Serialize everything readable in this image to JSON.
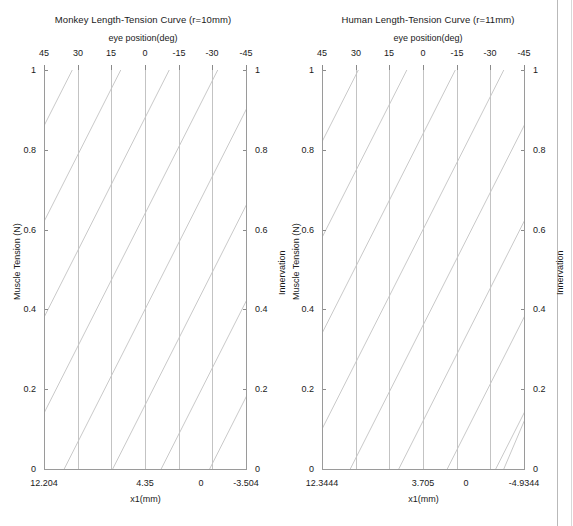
{
  "figure": {
    "background": "#ffffff",
    "curve_color": "#c9c9c9",
    "frame_color": "#9a9a9a",
    "grid_color": "#c3c3c3"
  },
  "chart_data": [
    {
      "type": "line",
      "panel": "left",
      "title": "Monkey Length-Tension Curve (r=10mm)",
      "top_axis_label": "eye position(deg)",
      "xlabel": "x1(mm)",
      "ylabel_left": "Muscle Tension (N)",
      "ylabel_right": "Innervation",
      "top_ticks": [
        "45",
        "30",
        "15",
        "0",
        "-15",
        "-30",
        "-45"
      ],
      "top_tick_values": [
        45,
        30,
        15,
        0,
        -15,
        -30,
        -45
      ],
      "xlim_deg": [
        45,
        -45
      ],
      "ylim": [
        0,
        1
      ],
      "y_ticks_left": [
        "0",
        "0.2",
        "0.4",
        "0.6",
        "0.8",
        "1"
      ],
      "y_tick_values_left": [
        0,
        0.2,
        0.4,
        0.6,
        0.8,
        1
      ],
      "y_ticks_right": [
        "0",
        "0.2",
        "0.4",
        "0.6",
        "0.8",
        "1"
      ],
      "y_tick_values_right": [
        0,
        0.2,
        0.4,
        0.6,
        0.8,
        1
      ],
      "x1_axis_labels": [
        "12.204",
        "4.35",
        "0",
        "-3.504"
      ],
      "x1_axis_values": [
        12.204,
        4.35,
        0,
        -3.504
      ],
      "x1_axis_positions_frac": [
        0.0,
        0.5,
        0.777,
        1.0
      ],
      "zero_corner_labels": [
        "0",
        "0"
      ],
      "grid": "vertical-only",
      "legend": "none",
      "series_description": "Family of parallel length-tension lines, one per innervation level; each rises linearly from the x-axis toward the upper-right, cropped by the plot box.",
      "series": [
        {
          "name": "L1",
          "x_start_frac": -0.62,
          "y_start": 0.0,
          "x_end_frac": 0.38,
          "y_end": 1.0
        },
        {
          "name": "L2",
          "x_start_frac": -0.38,
          "y_start": 0.0,
          "x_end_frac": 0.62,
          "y_end": 1.0
        },
        {
          "name": "L3",
          "x_start_frac": -0.14,
          "y_start": 0.0,
          "x_end_frac": 0.86,
          "y_end": 1.0
        },
        {
          "name": "L4",
          "x_start_frac": 0.1,
          "y_start": 0.0,
          "x_end_frac": 1.1,
          "y_end": 1.0
        },
        {
          "name": "L5",
          "x_start_frac": 0.34,
          "y_start": 0.0,
          "x_end_frac": 1.34,
          "y_end": 1.0
        },
        {
          "name": "L6",
          "x_start_frac": 0.58,
          "y_start": 0.0,
          "x_end_frac": 1.58,
          "y_end": 1.0
        },
        {
          "name": "L7",
          "x_start_frac": 0.82,
          "y_start": 0.0,
          "x_end_frac": 1.82,
          "y_end": 1.0
        },
        {
          "name": "L8",
          "x_start_frac": -0.86,
          "y_start": 0.0,
          "x_end_frac": 0.14,
          "y_end": 1.0
        }
      ]
    },
    {
      "type": "line",
      "panel": "right",
      "title": "Human Length-Tension Curve (r=11mm)",
      "top_axis_label": "eye position(deg)",
      "xlabel": "x1(mm)",
      "ylabel_left": "Muscle Tension (N)",
      "ylabel_right": "Innervation",
      "top_ticks": [
        "45",
        "30",
        "15",
        "0",
        "-15",
        "-30",
        "-45"
      ],
      "top_tick_values": [
        45,
        30,
        15,
        0,
        -15,
        -30,
        -45
      ],
      "xlim_deg": [
        45,
        -45
      ],
      "ylim": [
        0,
        1
      ],
      "y_ticks_left": [
        "0",
        "0.2",
        "0.4",
        "0.6",
        "0.8",
        "1"
      ],
      "y_tick_values_left": [
        0,
        0.2,
        0.4,
        0.6,
        0.8,
        1
      ],
      "y_ticks_right": [
        "0",
        "0.2",
        "0.4",
        "0.6",
        "0.8",
        "1"
      ],
      "y_tick_values_right": [
        0,
        0.2,
        0.4,
        0.6,
        0.8,
        1
      ],
      "x1_axis_labels": [
        "12.3444",
        "3.705",
        "0",
        "-4.9344"
      ],
      "x1_axis_values": [
        12.3444,
        3.705,
        0,
        -4.9344
      ],
      "x1_axis_positions_frac": [
        0.0,
        0.5,
        0.715,
        1.0
      ],
      "zero_corner_labels": [
        "0",
        "0"
      ],
      "grid": "vertical-only",
      "legend": "none",
      "series_description": "Family of parallel length-tension lines, one per innervation level; each rises linearly from the x-axis toward the upper-right, cropped by the plot box.",
      "series": [
        {
          "name": "L1",
          "x_start_frac": -0.58,
          "y_start": 0.0,
          "x_end_frac": 0.42,
          "y_end": 1.0
        },
        {
          "name": "L2",
          "x_start_frac": -0.34,
          "y_start": 0.0,
          "x_end_frac": 0.66,
          "y_end": 1.0
        },
        {
          "name": "L3",
          "x_start_frac": -0.1,
          "y_start": 0.0,
          "x_end_frac": 0.9,
          "y_end": 1.0
        },
        {
          "name": "L4",
          "x_start_frac": 0.14,
          "y_start": 0.0,
          "x_end_frac": 1.14,
          "y_end": 1.0
        },
        {
          "name": "L5",
          "x_start_frac": 0.38,
          "y_start": 0.0,
          "x_end_frac": 1.38,
          "y_end": 1.0
        },
        {
          "name": "L6",
          "x_start_frac": 0.62,
          "y_start": 0.0,
          "x_end_frac": 1.62,
          "y_end": 1.0
        },
        {
          "name": "L7",
          "x_start_frac": 0.86,
          "y_start": 0.0,
          "x_end_frac": 1.86,
          "y_end": 1.0
        },
        {
          "name": "L8",
          "x_start_frac": 0.9,
          "y_start": 0.0,
          "x_end_frac": 1.74,
          "y_end": 1.0
        },
        {
          "name": "L9",
          "x_start_frac": -0.82,
          "y_start": 0.0,
          "x_end_frac": 0.18,
          "y_end": 1.0
        }
      ]
    }
  ]
}
